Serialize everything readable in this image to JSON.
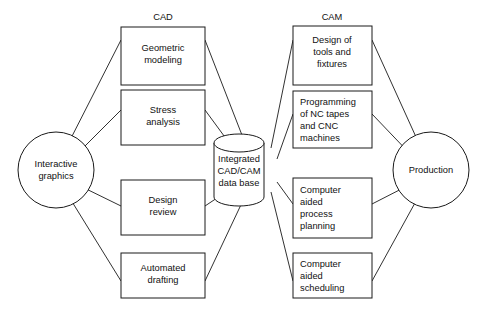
{
  "figure": {
    "background_color": "#ffffff",
    "line_color": "#1a1a1a",
    "text_color": "#111111"
  },
  "column_headings": {
    "cad": "CAD",
    "cam": "CAM"
  },
  "left_node": {
    "label_line1": "Interactive",
    "label_line2": "graphics",
    "shape": "circle"
  },
  "right_node": {
    "label_line1": "Production",
    "shape": "circle"
  },
  "center_node": {
    "label_line1": "Integrated",
    "label_line2": "CAD/CAM",
    "label_line3": "data base",
    "shape": "cylinder"
  },
  "cad_boxes": [
    {
      "lines": [
        "Geometric",
        "modeling"
      ],
      "align": "center"
    },
    {
      "lines": [
        "Stress",
        "analysis"
      ],
      "align": "center"
    },
    {
      "lines": [
        "Design",
        "review"
      ],
      "align": "center"
    },
    {
      "lines": [
        "Automated",
        "drafting"
      ],
      "align": "center"
    }
  ],
  "cam_boxes": [
    {
      "lines": [
        "Design of",
        "tools and",
        "fixtures"
      ],
      "align": "center"
    },
    {
      "lines": [
        "Programming",
        "of NC tapes",
        "and CNC",
        "machines"
      ],
      "align": "left"
    },
    {
      "lines": [
        "Computer",
        "aided",
        "process",
        "planning"
      ],
      "align": "left"
    },
    {
      "lines": [
        "Computer",
        "aided",
        "scheduling"
      ],
      "align": "left"
    }
  ]
}
